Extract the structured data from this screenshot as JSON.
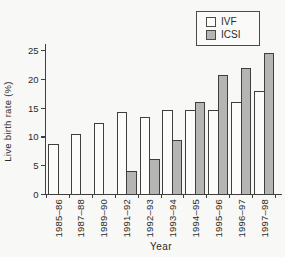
{
  "figure": {
    "background": "#f8f8f6",
    "axis_color": "#3f3f3d",
    "text_color": "#2b2b29"
  },
  "chart_data": {
    "type": "bar",
    "title": "",
    "xlabel": "Year",
    "ylabel": "Live birth rate (%)",
    "categories": [
      "1985–86",
      "1987–88",
      "1989–90",
      "1991–92",
      "1992–93",
      "1993–94",
      "1994–95",
      "1995–96",
      "1996–97",
      "1997–98"
    ],
    "series": [
      {
        "name": "IVF",
        "fill": "#fcfcfa",
        "values": [
          8.7,
          10.4,
          12.3,
          14.2,
          13.3,
          14.5,
          14.5,
          14.6,
          15.9,
          17.8
        ]
      },
      {
        "name": "ICSI",
        "fill": "#b5b5b3",
        "values": [
          null,
          null,
          null,
          4.0,
          6.0,
          9.4,
          16.0,
          20.7,
          21.9,
          24.5
        ]
      }
    ],
    "ylim": [
      0,
      25
    ],
    "yticks": [
      0,
      5,
      10,
      15,
      20,
      25
    ],
    "grid": false,
    "legend_position": "top-right",
    "bar_outline": "#3f3f3d"
  }
}
